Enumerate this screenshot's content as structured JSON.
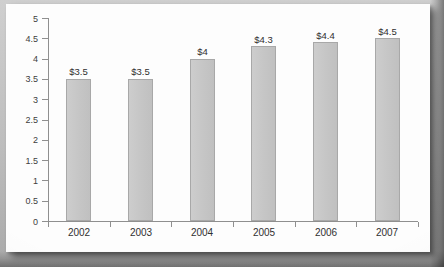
{
  "chart_data": {
    "type": "bar",
    "title": "",
    "subtitle": "",
    "xlabel": "",
    "ylabel": "",
    "categories": [
      "2002",
      "2003",
      "2004",
      "2005",
      "2006",
      "2007"
    ],
    "values": [
      3.5,
      3.5,
      4,
      4.3,
      4.4,
      4.5
    ],
    "data_labels": [
      "$3.5",
      "$3.5",
      "$4",
      "$4.3",
      "$4.4",
      "$4.5"
    ],
    "series": [
      {
        "name": "",
        "values": [
          3.5,
          3.5,
          4,
          4.3,
          4.4,
          4.5
        ]
      }
    ],
    "ylim": [
      0,
      5
    ],
    "ytick_labels": [
      "0",
      "0.5",
      "1",
      "1.5",
      "2",
      "2.5",
      "3",
      "3.5",
      "4",
      "4.5",
      "5"
    ],
    "ytick_values": [
      0,
      0.5,
      1,
      1.5,
      2,
      2.5,
      3,
      3.5,
      4,
      4.5,
      5
    ],
    "grid": false,
    "legend": false,
    "legend_position": "none",
    "bar_color": "#c6c6c6",
    "bar_edge_color": "#a8a8a8",
    "axis_color": "#8f8f8f",
    "text_color": "#303030",
    "background_color": "#fdfdfd"
  }
}
